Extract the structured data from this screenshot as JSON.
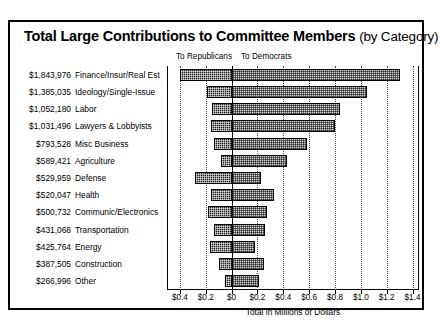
{
  "title": {
    "main": "Total Large Contributions to Committee Members",
    "suffix": "(by Category)"
  },
  "group_headers": {
    "republicans": "To Republicans",
    "democrats": "To Democrats"
  },
  "axis_title": "Total in Millions of Dollars",
  "chart_data": {
    "type": "bar",
    "orientation": "horizontal",
    "layout": "diverging-stacked",
    "title": "Total Large Contributions to Committee Members (by Category)",
    "xlabel": "Total in Millions of Dollars",
    "ylabel": "",
    "xlim": [
      -0.5,
      1.45
    ],
    "grid": true,
    "legend_position": "above-plot",
    "tick_labels": [
      "$0.4",
      "$0.2",
      "$0",
      "$0.2",
      "$0.4",
      "$0.6",
      "$0.8",
      "$1.0",
      "$1.2",
      "$1.4"
    ],
    "tick_values": [
      -0.4,
      -0.2,
      0,
      0.2,
      0.4,
      0.6,
      0.8,
      1.0,
      1.2,
      1.4
    ],
    "categories": [
      "Finance/Insur/Real Est",
      "Ideology/Single-Issue",
      "Labor",
      "Lawyers & Lobbyists",
      "Misc Business",
      "Agriculture",
      "Defense",
      "Health",
      "Communic/Electronics",
      "Transportation",
      "Energy",
      "Construction",
      "Other"
    ],
    "totals_labels": [
      "$1,843,976",
      "$1,385,035",
      "$1,052,180",
      "$1,031,496",
      "$793,528",
      "$589,421",
      "$529,959",
      "$520,047",
      "$500,732",
      "$431,068",
      "$425,764",
      "$387,505",
      "$266,996"
    ],
    "totals": [
      1843976,
      1385035,
      1052180,
      1031496,
      793528,
      589421,
      529959,
      520047,
      500732,
      431068,
      425764,
      387505,
      266996
    ],
    "series": [
      {
        "name": "To Republicans",
        "color": "#1c1c1c",
        "pattern": "dense-checker",
        "direction": "left",
        "values": [
          0.4,
          0.19,
          0.15,
          0.16,
          0.14,
          0.08,
          0.28,
          0.16,
          0.18,
          0.14,
          0.17,
          0.1,
          0.05
        ]
      },
      {
        "name": "To Democrats",
        "color": "#d2d2d2",
        "pattern": "stipple",
        "direction": "right",
        "values": [
          1.3,
          1.05,
          0.84,
          0.8,
          0.58,
          0.43,
          0.23,
          0.33,
          0.27,
          0.26,
          0.18,
          0.25,
          0.21
        ]
      }
    ]
  }
}
